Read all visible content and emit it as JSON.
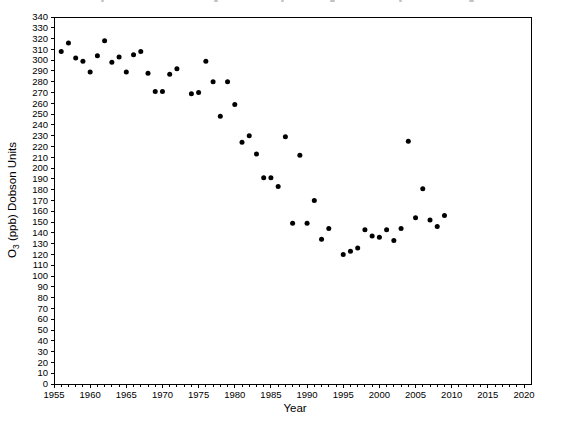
{
  "figure": {
    "background_color": "#ffffff",
    "frame_color": "#000000",
    "title_visible": ""
  },
  "chart_data": {
    "type": "scatter",
    "title": "",
    "xlabel": "Year",
    "ylabel": "O3 (ppb) Dobson Units",
    "ylabel_parts": [
      "O",
      "3",
      " (ppb) Dobson Units"
    ],
    "xlim": [
      1955,
      2020
    ],
    "ylim": [
      0,
      340
    ],
    "x_major_step": 5,
    "x_minor_step": 1,
    "y_tick_step": 10,
    "grid": false,
    "legend": null,
    "marker": {
      "shape": "circle",
      "color": "#000000",
      "diameter_px": 5
    },
    "x_tick_labels": [
      "1955",
      "1960",
      "1965",
      "1970",
      "1975",
      "1980",
      "1985",
      "1990",
      "1995",
      "2000",
      "2005",
      "2010",
      "2015",
      "2020"
    ],
    "y_tick_labels": [
      "0",
      "10",
      "20",
      "30",
      "40",
      "50",
      "60",
      "70",
      "80",
      "90",
      "100",
      "110",
      "120",
      "130",
      "140",
      "150",
      "160",
      "170",
      "180",
      "190",
      "200",
      "210",
      "220",
      "230",
      "240",
      "250",
      "260",
      "270",
      "280",
      "290",
      "300",
      "310",
      "320",
      "330",
      "340"
    ],
    "points": [
      [
        1956,
        308
      ],
      [
        1957,
        316
      ],
      [
        1958,
        302
      ],
      [
        1959,
        299
      ],
      [
        1960,
        289
      ],
      [
        1961,
        304
      ],
      [
        1962,
        318
      ],
      [
        1963,
        298
      ],
      [
        1964,
        303
      ],
      [
        1965,
        289
      ],
      [
        1966,
        305
      ],
      [
        1967,
        308
      ],
      [
        1968,
        288
      ],
      [
        1969,
        271
      ],
      [
        1970,
        271
      ],
      [
        1971,
        287
      ],
      [
        1972,
        292
      ],
      [
        1974,
        269
      ],
      [
        1975,
        270
      ],
      [
        1976,
        299
      ],
      [
        1977,
        280
      ],
      [
        1978,
        248
      ],
      [
        1979,
        280
      ],
      [
        1980,
        259
      ],
      [
        1981,
        224
      ],
      [
        1982,
        230
      ],
      [
        1983,
        213
      ],
      [
        1984,
        191
      ],
      [
        1985,
        191
      ],
      [
        1986,
        183
      ],
      [
        1987,
        229
      ],
      [
        1988,
        149
      ],
      [
        1989,
        212
      ],
      [
        1990,
        149
      ],
      [
        1991,
        170
      ],
      [
        1992,
        134
      ],
      [
        1993,
        144
      ],
      [
        1995,
        120
      ],
      [
        1996,
        123
      ],
      [
        1997,
        126
      ],
      [
        1998,
        143
      ],
      [
        1999,
        137
      ],
      [
        2000,
        136
      ],
      [
        2001,
        143
      ],
      [
        2002,
        133
      ],
      [
        2003,
        144
      ],
      [
        2004,
        225
      ],
      [
        2005,
        154
      ],
      [
        2006,
        181
      ],
      [
        2007,
        152
      ],
      [
        2008,
        146
      ],
      [
        2009,
        156
      ]
    ]
  }
}
